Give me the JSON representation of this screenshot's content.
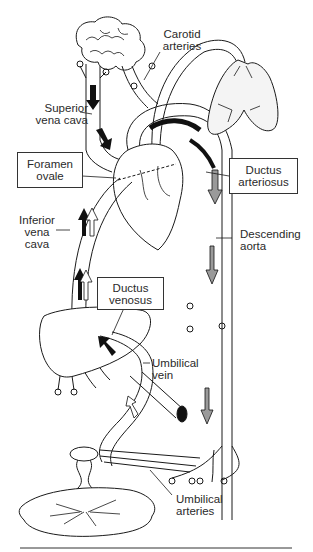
{
  "figure": {
    "labels": {
      "carotid_arteries": [
        "Carotid",
        "arteries"
      ],
      "superior_vena_cava": [
        "Superior",
        "vena cava"
      ],
      "foramen_ovale": [
        "Foramen",
        "ovale"
      ],
      "ductus_arteriosus": [
        "Ductus",
        "arteriosus"
      ],
      "inferior_vena_cava": [
        "Inferior",
        "vena",
        "cava"
      ],
      "descending_aorta": [
        "Descending",
        "aorta"
      ],
      "ductus_venosus": [
        "Ductus",
        "venosus"
      ],
      "umbilical_vein": [
        "Umbilical",
        "vein"
      ],
      "umbilical_arteries": [
        "Umbilical",
        "arteries"
      ]
    },
    "boxed_labels": [
      "foramen_ovale",
      "ductus_arteriosus",
      "ductus_venosus"
    ],
    "organs": [
      "brain",
      "lungs",
      "heart",
      "liver",
      "placenta",
      "umbilical cord"
    ],
    "colors": {
      "line": "#1a1a1a",
      "arrow_dark": "#111111",
      "arrow_light": "#ffffff",
      "arrow_gray": "#9a9a9a",
      "lung_stipple": "#bdbdbd"
    }
  }
}
